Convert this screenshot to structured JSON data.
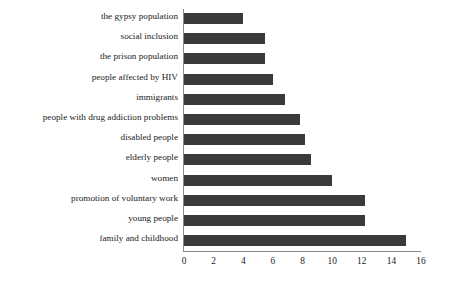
{
  "chart_data": {
    "type": "bar",
    "orientation": "horizontal",
    "title": "",
    "xlabel": "",
    "ylabel": "",
    "xlim": [
      0,
      16
    ],
    "xticks": [
      0,
      2,
      4,
      6,
      8,
      10,
      12,
      14,
      16
    ],
    "grid": false,
    "legend": null,
    "bar_color": "#3a3a3a",
    "axis_color": "#8a8a8a",
    "background_color": "#ffffff",
    "categories": [
      "the gypsy population",
      "social inclusion",
      "the prison population",
      "people affected by HIV",
      "immigrants",
      "people with drug addiction problems",
      "disabled people",
      "elderly people",
      "women",
      "promotion of voluntary work",
      "young people",
      "family and childhood"
    ],
    "values": [
      4,
      5.5,
      5.5,
      6,
      6.8,
      7.8,
      8.2,
      8.6,
      10,
      12.2,
      12.2,
      15
    ]
  }
}
